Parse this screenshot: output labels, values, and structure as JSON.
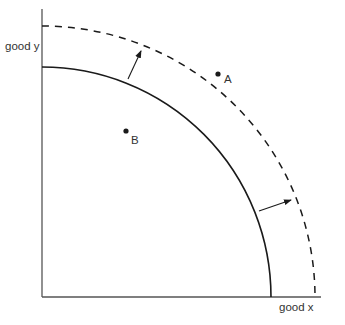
{
  "diagram": {
    "type": "production-possibilities-frontier",
    "axes": {
      "y_label": "good y",
      "x_label": "good x"
    },
    "curves": [
      {
        "name": "original-frontier",
        "style": "solid"
      },
      {
        "name": "shifted-frontier",
        "style": "dashed"
      }
    ],
    "points": [
      {
        "label": "A",
        "position": "outside original frontier, near shifted frontier"
      },
      {
        "label": "B",
        "position": "inside original frontier"
      }
    ],
    "arrows": [
      {
        "from": "original-frontier",
        "to": "shifted-frontier",
        "location": "upper"
      },
      {
        "from": "original-frontier",
        "to": "shifted-frontier",
        "location": "right"
      }
    ],
    "colors": {
      "line": "#1a1a1a",
      "axis": "#555555",
      "text": "#333333"
    }
  }
}
